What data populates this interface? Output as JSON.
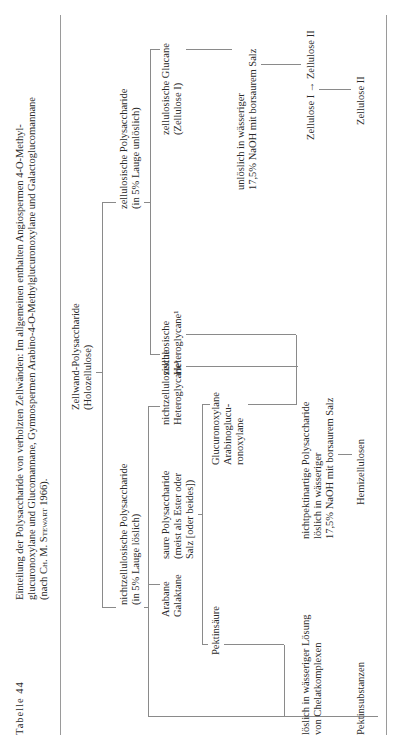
{
  "table": {
    "label": "Tabelle 44",
    "caption": [
      "Einteilung der Polysaccharide von verholzten Zellwänden: Im allgemeinen enthalten Angiospermen 4-O-Methyl-",
      "glucuronoxylane und Glucomannane, Gymnospermen Arabino-4-O-Methylglucuronoxylane und Galactoglucomannane",
      "(nach CH. M. STEWART 1966)."
    ]
  },
  "tree": {
    "root": [
      "Zellwand-Polysaccharide",
      "(Holozellulose)"
    ],
    "noncellulosic": [
      "nichtzellulosische Polysaccharide",
      "(in 5% Lauge löslich)"
    ],
    "cellulosic": [
      "zellulosische Polysaccharide",
      "(in 5% Lauge unlöslich)"
    ],
    "cellulosic_heteroglycans": [
      "zellulosische",
      "Heteroglycane¹"
    ],
    "cellulosic_glucans": [
      "zellulosische Glucane",
      "(Zellulose I)"
    ],
    "insoluble_naoh": [
      "unlöslich in wässeriger",
      "17,5% NaOH mit borsaurem Salz"
    ],
    "cellulose_conversion": "Zellulose I → Zellulose II",
    "cellulose_ii": "Zellulose II",
    "arabane_galaktane": [
      "Arabane",
      "Galaktane"
    ],
    "acidic_polysaccharides": [
      "saure Polysaccharide",
      "(meist als Ester oder",
      "Salz [oder beides])"
    ],
    "noncellulosic_heteroglycans": [
      "nichtzellulosische",
      "Heteroglycane¹"
    ],
    "pectic_acid": "Pektinsäure",
    "glucuronoxylans": [
      "Glucuronoxylane",
      "Arabinoglucu-",
      "ronoxylane"
    ],
    "soluble_chelate": [
      "löslich in wässeriger Lösung",
      "von Chelatkomplexen"
    ],
    "nonpectic": [
      "nichtpektinartige Polysaccharide",
      "löslich in wässeriger",
      "17,5% NaOH mit borsaurem Salz"
    ],
    "pectic_substances": "Pektinsubstanzen",
    "hemicelluloses": "Hemizellulosen"
  }
}
